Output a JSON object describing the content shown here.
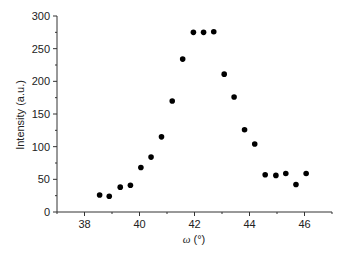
{
  "chart_data": {
    "type": "scatter",
    "title": "",
    "xlabel": "ω (°)",
    "ylabel": "Intensity (a.u.)",
    "xlim": [
      37,
      47
    ],
    "ylim": [
      0,
      300
    ],
    "xticks": [
      38,
      40,
      42,
      44,
      46
    ],
    "yticks": [
      0,
      50,
      100,
      150,
      200,
      250,
      300
    ],
    "grid": false,
    "legend": null,
    "marker_color": "#000000",
    "series": [
      {
        "name": "Intensity",
        "x": [
          38.55,
          38.9,
          39.3,
          39.67,
          40.05,
          40.42,
          40.8,
          41.19,
          41.57,
          41.96,
          42.33,
          42.7,
          43.08,
          43.44,
          43.82,
          44.19,
          44.57,
          44.96,
          45.32,
          45.69,
          46.06
        ],
        "y": [
          26,
          24,
          38,
          41,
          68,
          84,
          115,
          170,
          234,
          275,
          275,
          276,
          211,
          176,
          126,
          104,
          57,
          56,
          59,
          42,
          59
        ]
      }
    ]
  },
  "axes": {
    "xlabel_omega": "ω",
    "xlabel_unit": " (°)",
    "ylabel": "Intensity (a.u.)",
    "xtick_labels": [
      "38",
      "40",
      "42",
      "44",
      "46"
    ],
    "ytick_labels": [
      "0",
      "50",
      "100",
      "150",
      "200",
      "250",
      "300"
    ]
  }
}
